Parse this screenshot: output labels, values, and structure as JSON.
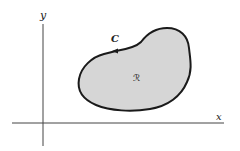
{
  "diagram": {
    "type": "region-in-plane",
    "axes": {
      "x_label": "x",
      "y_label": "y"
    },
    "curve": {
      "label": "C",
      "orientation": "counterclockwise"
    },
    "region": {
      "label": "ℛ"
    },
    "colors": {
      "background": "#ffffff",
      "axis": "#333333",
      "curve": "#1a1a1a",
      "region_fill": "#d6d6d6"
    }
  }
}
